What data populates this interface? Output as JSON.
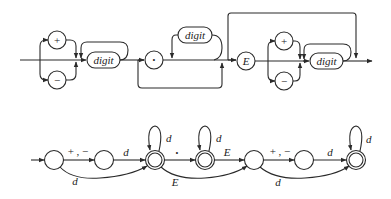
{
  "syntax_diagram": {
    "sign_options": [
      "+",
      "−"
    ],
    "integer_part_label": "digit",
    "decimal_point": "•",
    "fraction_label": "digit",
    "exponent_label": "E",
    "exponent_sign_options": [
      "+",
      "−"
    ],
    "exponent_digits_label": "digit"
  },
  "automaton": {
    "states": [
      {
        "id": "q0",
        "accepting": false
      },
      {
        "id": "q1",
        "accepting": false
      },
      {
        "id": "q2",
        "accepting": true
      },
      {
        "id": "q3",
        "accepting": true
      },
      {
        "id": "q4",
        "accepting": false
      },
      {
        "id": "q5",
        "accepting": false
      },
      {
        "id": "q6",
        "accepting": true
      }
    ],
    "labels": {
      "q0_q1": "+ , −",
      "q1_q2": "d",
      "q0_q2": "d",
      "q2_loop": "d",
      "q2_q3": "•",
      "q3_loop": "d",
      "q3_q4": "E",
      "q2_q4": "E",
      "q4_q5": "+ , −",
      "q5_q6": "d",
      "q4_q6": "d",
      "q6_loop": "d"
    }
  }
}
